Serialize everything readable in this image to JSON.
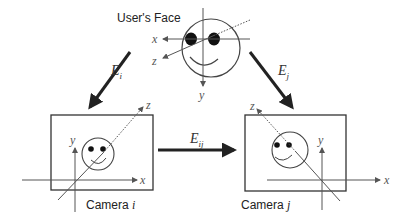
{
  "face": {
    "title": "User's Face",
    "axes": {
      "x": "x",
      "y": "y",
      "z": "z"
    }
  },
  "transforms": {
    "left": {
      "base": "E",
      "sub": "i"
    },
    "right": {
      "base": "E",
      "sub": "j"
    },
    "between": {
      "base": "E",
      "sub": "ij"
    }
  },
  "cameras": [
    {
      "label": "Camera",
      "index": "i",
      "axes": {
        "x": "x",
        "y": "y",
        "z": "z"
      }
    },
    {
      "label": "Camera",
      "index": "j",
      "axes": {
        "x": "x",
        "y": "y",
        "z": "z"
      }
    }
  ],
  "colors": {
    "line": "#333333",
    "thin": "#555555",
    "background": "#ffffff"
  }
}
